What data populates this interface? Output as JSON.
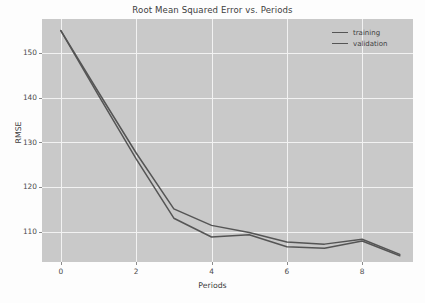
{
  "chart_data": {
    "type": "line",
    "title": "Root Mean Squared Error vs. Periods",
    "xlabel": "Periods",
    "ylabel": "RMSE",
    "x": [
      0,
      1,
      2,
      3,
      4,
      5,
      6,
      7,
      8,
      9
    ],
    "series": [
      {
        "name": "training",
        "values": [
          155.0,
          140.5,
          126.3,
          113.0,
          108.8,
          109.3,
          106.6,
          106.3,
          107.9,
          104.6
        ]
      },
      {
        "name": "validation",
        "values": [
          155.0,
          141.2,
          127.6,
          115.1,
          111.4,
          109.8,
          107.7,
          107.2,
          108.3,
          104.9
        ]
      }
    ],
    "xticks": [
      0,
      2,
      4,
      6,
      8
    ],
    "yticks": [
      110,
      120,
      130,
      140,
      150
    ],
    "xlim": [
      -0.5,
      9.35
    ],
    "ylim": [
      103.2,
      157.6
    ],
    "grid": true,
    "legend_position": "upper right",
    "legend_frame": false,
    "colors": {
      "training_line": "#555555",
      "validation_line": "#555555",
      "plot_background": "#c9c9c9",
      "gridline": "#f2f2f2",
      "figure_background": "#fdfdfd",
      "text": "#3d3d3d"
    }
  },
  "legend": {
    "items": [
      {
        "label": "training"
      },
      {
        "label": "validation"
      }
    ]
  }
}
